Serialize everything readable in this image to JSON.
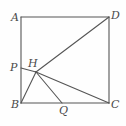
{
  "figure": {
    "name": "square-with-cevians-diagram",
    "type": "plane-geometry-figure",
    "stroke_color": "#555555",
    "label_color": "#4a4a4a",
    "background_color": "#fefefe",
    "points": {
      "A": {
        "label": "A",
        "x": 21,
        "y": 17,
        "label_x": 11,
        "label_y": 12
      },
      "D": {
        "label": "D",
        "x": 109,
        "y": 17,
        "label_x": 111,
        "label_y": 10
      },
      "B": {
        "label": "B",
        "x": 21,
        "y": 103,
        "label_x": 11,
        "label_y": 99
      },
      "C": {
        "label": "C",
        "x": 109,
        "y": 103,
        "label_x": 111,
        "label_y": 99
      },
      "P": {
        "label": "P",
        "x": 21,
        "y": 68,
        "label_x": 10,
        "label_y": 62
      },
      "H": {
        "label": "H",
        "x": 36,
        "y": 72,
        "label_x": 28,
        "label_y": 58
      },
      "Q": {
        "label": "Q",
        "x": 62,
        "y": 103,
        "label_x": 59,
        "label_y": 105
      }
    },
    "segments": [
      {
        "name": "side-AD",
        "from": "A",
        "to": "D"
      },
      {
        "name": "side-DC",
        "from": "D",
        "to": "C"
      },
      {
        "name": "side-CB",
        "from": "C",
        "to": "B"
      },
      {
        "name": "side-BA",
        "from": "B",
        "to": "A"
      },
      {
        "name": "segment-HD",
        "from": "H",
        "to": "D"
      },
      {
        "name": "segment-HC",
        "from": "H",
        "to": "C"
      },
      {
        "name": "segment-HB",
        "from": "H",
        "to": "B"
      },
      {
        "name": "segment-HQ",
        "from": "H",
        "to": "Q"
      },
      {
        "name": "segment-PH",
        "from": "P",
        "to": "H"
      }
    ]
  }
}
